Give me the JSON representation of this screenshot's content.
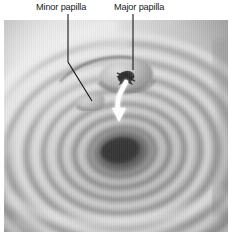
{
  "figure": {
    "kind": "anatomical-photograph",
    "modality": "endoscopic-view",
    "palette": {
      "background": "#ffffff",
      "label_text": "#1a1a1a",
      "leader_line": "#111111",
      "flow_arrow": "#fdfdfd",
      "tissue_light": "#efefef",
      "tissue_mid": "#a8a8a8",
      "tissue_dark": "#4a4a4a",
      "lumen_core": "#171717",
      "orifice": "#0d0d0d"
    }
  },
  "labels": {
    "minor_papilla": "Minor papilla",
    "major_papilla": "Major papilla"
  },
  "annotations": {
    "minor_leader": {
      "name": "minor-papilla-leader-line",
      "points": "68,14 68,62 92,101",
      "terminus_x": 92,
      "terminus_y": 101
    },
    "major_leader": {
      "name": "major-papilla-leader-line",
      "points": "133,14 133,70",
      "terminus_x": 133,
      "terminus_y": 70
    },
    "flow_arrow": {
      "name": "bile-flow-arrow",
      "description": "white curved arrow from papillary orifice directed inferiorly",
      "path": "M126,82 C121,92 116,98 118,110",
      "head": "112,108 126,108 119,122"
    }
  },
  "structures": {
    "major_papilla": {
      "cx": 126,
      "cy": 74,
      "rx": 26,
      "ry": 18
    },
    "major_orifice": {
      "cx": 126,
      "cy": 77,
      "r": 7
    },
    "minor_papilla": {
      "cx": 92,
      "cy": 101,
      "rx": 14,
      "ry": 8
    },
    "lumen": {
      "cx": 122,
      "cy": 152,
      "rx": 24,
      "ry": 17
    }
  },
  "folds": {
    "name": "circular-mucosal-folds",
    "center_x": 122,
    "center_y": 152,
    "rings": [
      {
        "rx": 24,
        "ry": 17,
        "rot": -8
      },
      {
        "rx": 38,
        "ry": 28,
        "rot": -7
      },
      {
        "rx": 53,
        "ry": 40,
        "rot": -6
      },
      {
        "rx": 69,
        "ry": 53,
        "rot": -5
      },
      {
        "rx": 86,
        "ry": 67,
        "rot": -4
      },
      {
        "rx": 104,
        "ry": 82,
        "rot": -3
      },
      {
        "rx": 124,
        "ry": 98,
        "rot": -2
      },
      {
        "rx": 146,
        "ry": 116,
        "rot": -1
      }
    ]
  }
}
